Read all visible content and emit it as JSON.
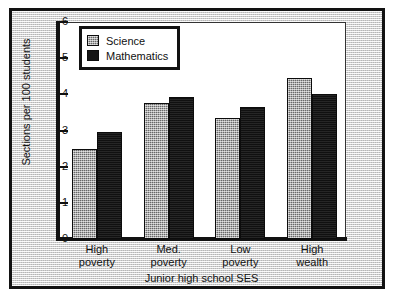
{
  "chart_data": {
    "type": "bar",
    "title": "",
    "xlabel": "Junior high school SES",
    "ylabel": "Sections per 100 students",
    "categories": [
      "High poverty",
      "Med. poverty",
      "Low poverty",
      "High wealth"
    ],
    "category_lines": [
      [
        "High",
        "poverty"
      ],
      [
        "Med.",
        "poverty"
      ],
      [
        "Low",
        "poverty"
      ],
      [
        "High",
        "wealth"
      ]
    ],
    "series": [
      {
        "name": "Science",
        "values": [
          2.5,
          3.77,
          3.35,
          4.45
        ],
        "color": "#8e8e8e"
      },
      {
        "name": "Mathematics",
        "values": [
          2.95,
          3.92,
          3.65,
          4.0
        ],
        "color": "#151515"
      }
    ],
    "ylim": [
      0,
      6
    ],
    "yticks": [
      0,
      1,
      2,
      3,
      4,
      5,
      6
    ],
    "ytick_labels": [
      "0",
      "1",
      "2",
      "3",
      "4",
      "5",
      "6"
    ],
    "grid": false,
    "legend_position": "top-left"
  }
}
